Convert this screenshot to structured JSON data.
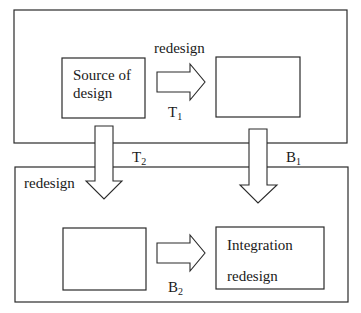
{
  "diagram": {
    "top_stage": {
      "source_box": {
        "line1": "Source of",
        "line2": "design"
      },
      "arrow_label": "redesign",
      "arrow_transfer": {
        "letter": "T",
        "index": "1"
      },
      "target_box": {
        "text": ""
      }
    },
    "connectors": {
      "left_down": {
        "letter": "T",
        "index": "2",
        "label": "redesign"
      },
      "right_down": {
        "letter": "B",
        "index": "1"
      }
    },
    "bottom_stage": {
      "left_box": {
        "text": ""
      },
      "arrow_transfer": {
        "letter": "B",
        "index": "2"
      },
      "integration_box": {
        "line1": "Integration",
        "line2": "redesign"
      }
    }
  }
}
